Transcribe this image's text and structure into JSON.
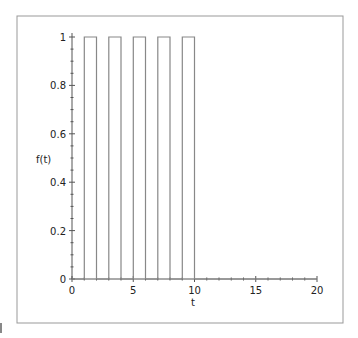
{
  "chart_data": {
    "type": "line",
    "title": "",
    "xlabel": "t",
    "ylabel": "f(t)",
    "xlim": [
      0,
      20
    ],
    "ylim": [
      0,
      1
    ],
    "grid": false,
    "legend": null,
    "x_ticks": [
      "0",
      "5",
      "10",
      "15",
      "20"
    ],
    "y_ticks": [
      "0",
      "0.2",
      "0.4",
      "0.6",
      "0.8",
      "1"
    ],
    "series": [
      {
        "name": "f(t)",
        "description": "rectangular pulse train: value 1 on [1,2],[3,4],[5,6],[7,8],[9,10], 0 elsewhere",
        "x": [
          0,
          1,
          1,
          2,
          2,
          3,
          3,
          4,
          4,
          5,
          5,
          6,
          6,
          7,
          7,
          8,
          8,
          9,
          9,
          10,
          10,
          20
        ],
        "y": [
          0,
          0,
          1,
          1,
          0,
          0,
          1,
          1,
          0,
          0,
          1,
          1,
          0,
          0,
          1,
          1,
          0,
          0,
          1,
          1,
          0,
          0
        ]
      }
    ],
    "pulses": [
      {
        "start": 1,
        "end": 2,
        "height": 1
      },
      {
        "start": 3,
        "end": 4,
        "height": 1
      },
      {
        "start": 5,
        "end": 6,
        "height": 1
      },
      {
        "start": 7,
        "end": 8,
        "height": 1
      },
      {
        "start": 9,
        "end": 10,
        "height": 1
      }
    ]
  },
  "colors": {
    "line": "#888888",
    "axis": "#555555",
    "frame": "#999999",
    "text": "#222222"
  }
}
